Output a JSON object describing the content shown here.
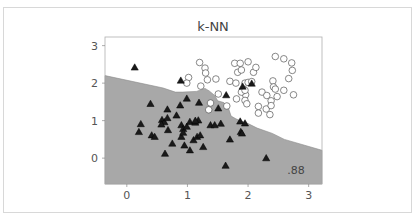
{
  "chart_data": {
    "type": "scatter",
    "title": "k-NN",
    "xlabel": "",
    "ylabel": "",
    "xlim": [
      -0.36,
      3.22
    ],
    "ylim": [
      -0.69,
      3.23
    ],
    "x_ticks": [
      0,
      1,
      2,
      3
    ],
    "y_ticks": [
      0,
      1,
      2,
      3
    ],
    "grid": false,
    "annotation": ".88",
    "decision_region": {
      "description": "Shaded (gray) region below boundary = triangle class; white region above = circle class",
      "fill_color": "#a8a8a8",
      "boundary": [
        [
          -0.36,
          2.2
        ],
        [
          0.6,
          1.87
        ],
        [
          0.8,
          1.76
        ],
        [
          0.92,
          1.76
        ],
        [
          1.15,
          1.78
        ],
        [
          1.29,
          1.86
        ],
        [
          1.36,
          1.79
        ],
        [
          1.45,
          1.67
        ],
        [
          1.5,
          1.53
        ],
        [
          1.6,
          1.48
        ],
        [
          1.67,
          1.37
        ],
        [
          1.72,
          1.12
        ],
        [
          1.8,
          1.05
        ],
        [
          1.9,
          0.98
        ],
        [
          2.0,
          0.92
        ],
        [
          2.15,
          0.8
        ],
        [
          2.4,
          0.66
        ],
        [
          2.6,
          0.5
        ],
        [
          3.22,
          0.21
        ]
      ]
    },
    "series": [
      {
        "name": "class 0",
        "marker": "circle",
        "color": "#ffffff",
        "edgecolor": "#555555",
        "points": [
          [
            1.2,
            2.55
          ],
          [
            1.29,
            2.4
          ],
          [
            1.3,
            2.27
          ],
          [
            1.33,
            2.09
          ],
          [
            1.02,
            2.15
          ],
          [
            0.99,
            2.0
          ],
          [
            1.22,
            1.92
          ],
          [
            1.47,
            2.11
          ],
          [
            1.51,
            1.71
          ],
          [
            1.38,
            1.47
          ],
          [
            1.35,
            1.29
          ],
          [
            1.65,
            1.39
          ],
          [
            1.7,
            2.05
          ],
          [
            1.78,
            2.53
          ],
          [
            1.83,
            2.29
          ],
          [
            1.87,
            2.53
          ],
          [
            1.89,
            2.35
          ],
          [
            2.0,
            2.57
          ],
          [
            2.09,
            2.29
          ],
          [
            2.13,
            2.42
          ],
          [
            1.8,
            2.0
          ],
          [
            1.95,
            2.0
          ],
          [
            2.0,
            2.02
          ],
          [
            2.06,
            2.04
          ],
          [
            1.96,
            1.69
          ],
          [
            1.81,
            1.58
          ],
          [
            1.89,
            1.76
          ],
          [
            1.95,
            1.54
          ],
          [
            1.98,
            1.45
          ],
          [
            2.23,
            1.76
          ],
          [
            2.31,
            1.67
          ],
          [
            2.41,
            2.06
          ],
          [
            2.42,
            1.9
          ],
          [
            2.45,
            1.84
          ],
          [
            2.48,
            1.64
          ],
          [
            2.38,
            1.53
          ],
          [
            2.45,
            2.71
          ],
          [
            2.59,
            2.65
          ],
          [
            2.72,
            2.54
          ],
          [
            2.73,
            2.34
          ],
          [
            2.67,
            2.12
          ],
          [
            2.75,
            1.69
          ],
          [
            2.59,
            1.81
          ],
          [
            2.17,
            1.38
          ],
          [
            2.3,
            1.31
          ],
          [
            2.38,
            1.4
          ],
          [
            2.17,
            1.2
          ],
          [
            2.36,
            1.16
          ],
          [
            1.95,
            1.81
          ]
        ]
      },
      {
        "name": "class 1",
        "marker": "triangle",
        "color": "#1a1a1a",
        "edgecolor": "#000000",
        "points": [
          [
            0.13,
            2.42
          ],
          [
            0.89,
            2.07
          ],
          [
            0.39,
            1.45
          ],
          [
            0.99,
            1.59
          ],
          [
            0.67,
            1.3
          ],
          [
            1.19,
            1.48
          ],
          [
            0.88,
            1.41
          ],
          [
            1.51,
            1.33
          ],
          [
            1.64,
            1.68
          ],
          [
            0.58,
            1.02
          ],
          [
            0.62,
            0.96
          ],
          [
            0.67,
            1.07
          ],
          [
            0.82,
            1.14
          ],
          [
            0.57,
            0.9
          ],
          [
            0.68,
            0.75
          ],
          [
            0.9,
            0.88
          ],
          [
            0.93,
            0.78
          ],
          [
            0.99,
            0.84
          ],
          [
            1.04,
            0.97
          ],
          [
            1.13,
            0.95
          ],
          [
            1.18,
            1.01
          ],
          [
            0.23,
            0.91
          ],
          [
            0.2,
            0.7
          ],
          [
            0.41,
            0.61
          ],
          [
            0.46,
            0.57
          ],
          [
            0.75,
            0.39
          ],
          [
            0.9,
            0.57
          ],
          [
            0.95,
            0.34
          ],
          [
            1.04,
            0.21
          ],
          [
            1.1,
            0.48
          ],
          [
            1.16,
            0.57
          ],
          [
            1.21,
            0.61
          ],
          [
            1.26,
            0.3
          ],
          [
            1.38,
            0.88
          ],
          [
            1.45,
            0.88
          ],
          [
            1.55,
            0.92
          ],
          [
            1.87,
            0.98
          ],
          [
            1.95,
            0.93
          ],
          [
            1.88,
            0.7
          ],
          [
            1.9,
            0.66
          ],
          [
            1.7,
            0.5
          ],
          [
            0.63,
            0.12
          ],
          [
            1.63,
            -0.2
          ],
          [
            2.3,
            0.0
          ],
          [
            1.91,
            1.91
          ],
          [
            2.06,
            1.99
          ],
          [
            1.13,
            1.0
          ],
          [
            0.93,
            0.68
          ]
        ]
      }
    ]
  }
}
